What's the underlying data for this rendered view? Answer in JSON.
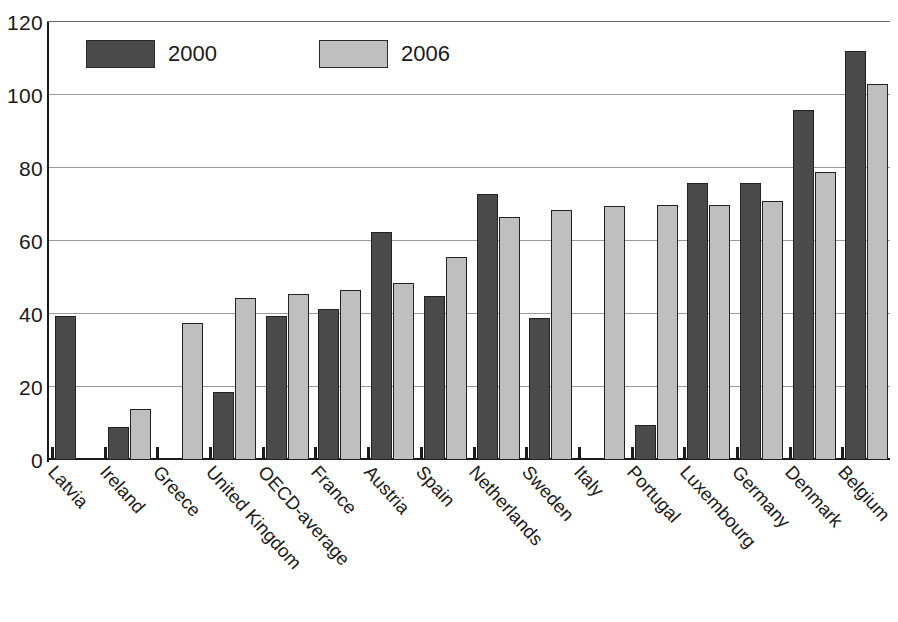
{
  "chart_data": {
    "type": "bar",
    "title": "",
    "subtitle": "",
    "xlabel": "",
    "ylabel": "",
    "ylim": [
      0,
      120
    ],
    "yticks": [
      0,
      20,
      40,
      60,
      80,
      100,
      120
    ],
    "ytick_labels": [
      "0",
      "20",
      "40",
      "60",
      "80",
      "100",
      "120"
    ],
    "grid": true,
    "legend_position": "top-left",
    "categories": [
      "Latvia",
      "Ireland",
      "Greece",
      "United Kingdom",
      "OECD-average",
      "France",
      "Austria",
      "Spain",
      "Netherlands",
      "Sweden",
      "Italy",
      "Portugal",
      "Luxembourg",
      "Germany",
      "Denmark",
      "Belgium"
    ],
    "series": [
      {
        "name": "2000",
        "color": "#4a4a4a",
        "values": [
          39.5,
          9.0,
          0,
          18.5,
          39.5,
          41.5,
          62.5,
          45.0,
          73.0,
          39.0,
          0,
          9.5,
          76.0,
          76.0,
          96.0,
          112.0
        ]
      },
      {
        "name": "2006",
        "color": "#bfbfbf",
        "values": [
          0,
          14.0,
          37.5,
          44.5,
          45.5,
          46.5,
          48.5,
          55.5,
          66.5,
          68.5,
          69.5,
          70.0,
          70.0,
          71.0,
          79.0,
          103.0
        ]
      }
    ]
  },
  "legend": {
    "items": [
      {
        "label": "2000",
        "color": "#4a4a4a"
      },
      {
        "label": "2006",
        "color": "#bfbfbf"
      }
    ]
  },
  "colors": {
    "series_2000": "#4a4a4a",
    "series_2006": "#bfbfbf",
    "grid": "#9a9a9a",
    "axis": "#1a1a1a",
    "background": "#ffffff"
  }
}
